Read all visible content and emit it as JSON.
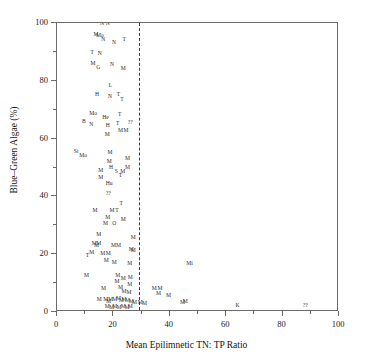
{
  "chart_data": {
    "type": "scatter",
    "title": "",
    "xlabel": "Mean Epilimnetic TN: TP Ratio",
    "ylabel": "Blue–Green Algae (%)",
    "xlim": [
      0,
      100
    ],
    "ylim": [
      0,
      100
    ],
    "grid": false,
    "legend": "none",
    "marker_style": "text-labels",
    "xticks_major": [
      0,
      20,
      40,
      60,
      80,
      100
    ],
    "xticks_minor": [
      10,
      30,
      50,
      70,
      90
    ],
    "yticks_major": [
      0,
      20,
      40,
      60,
      80,
      100
    ],
    "yticks_minor": [
      10,
      30,
      50,
      70,
      90
    ],
    "xtick_labels": [
      "0",
      "20",
      "40",
      "60",
      "80",
      "100"
    ],
    "ytick_labels": [
      "0",
      "20",
      "40",
      "60",
      "80",
      "100"
    ],
    "annotations": [
      {
        "type": "vline",
        "name": "threshold-line",
        "x": 29,
        "style": "dashed"
      }
    ],
    "points": [
      {
        "label": "N",
        "x": 16.0,
        "y": 99.5
      },
      {
        "label": "N",
        "x": 18.0,
        "y": 99.5
      },
      {
        "label": "M",
        "x": 13.8,
        "y": 95.8
      },
      {
        "label": "Mo",
        "x": 15.2,
        "y": 95.5
      },
      {
        "label": "N",
        "x": 16.4,
        "y": 94.0
      },
      {
        "label": "N",
        "x": 20.2,
        "y": 93.0
      },
      {
        "label": "T",
        "x": 23.8,
        "y": 94.0
      },
      {
        "label": "T",
        "x": 12.5,
        "y": 89.5
      },
      {
        "label": "N",
        "x": 15.2,
        "y": 89.3
      },
      {
        "label": "M",
        "x": 12.8,
        "y": 85.8
      },
      {
        "label": "G",
        "x": 14.6,
        "y": 84.3
      },
      {
        "label": "N",
        "x": 19.5,
        "y": 85.5
      },
      {
        "label": "M",
        "x": 23.5,
        "y": 84.0
      },
      {
        "label": "L",
        "x": 19.0,
        "y": 78.3
      },
      {
        "label": "H",
        "x": 14.2,
        "y": 75.0
      },
      {
        "label": "N",
        "x": 18.8,
        "y": 74.5
      },
      {
        "label": "T",
        "x": 21.8,
        "y": 75.0
      },
      {
        "label": "T",
        "x": 23.0,
        "y": 73.5
      },
      {
        "label": "Mo",
        "x": 12.8,
        "y": 68.5
      },
      {
        "label": "B",
        "x": 9.5,
        "y": 65.8
      },
      {
        "label": "N",
        "x": 12.2,
        "y": 64.8
      },
      {
        "label": "He",
        "x": 17.2,
        "y": 67.0
      },
      {
        "label": "T",
        "x": 22.2,
        "y": 68.0
      },
      {
        "label": "T",
        "x": 21.5,
        "y": 65.0
      },
      {
        "label": "??",
        "x": 26.0,
        "y": 65.5
      },
      {
        "label": "H",
        "x": 18.0,
        "y": 64.3
      },
      {
        "label": "M",
        "x": 22.5,
        "y": 62.5
      },
      {
        "label": "M",
        "x": 24.5,
        "y": 62.5
      },
      {
        "label": "M",
        "x": 17.8,
        "y": 61.3
      },
      {
        "label": "St",
        "x": 6.8,
        "y": 55.5
      },
      {
        "label": "Mo",
        "x": 9.3,
        "y": 54.0
      },
      {
        "label": "M",
        "x": 18.8,
        "y": 55.0
      },
      {
        "label": "M",
        "x": 18.5,
        "y": 52.0
      },
      {
        "label": "M",
        "x": 25.0,
        "y": 53.0
      },
      {
        "label": "H",
        "x": 19.2,
        "y": 50.0
      },
      {
        "label": "M",
        "x": 25.0,
        "y": 50.0
      },
      {
        "label": "M",
        "x": 15.5,
        "y": 48.8
      },
      {
        "label": "S",
        "x": 21.0,
        "y": 48.5
      },
      {
        "label": "M",
        "x": 23.3,
        "y": 48.5
      },
      {
        "label": "M",
        "x": 15.5,
        "y": 46.5
      },
      {
        "label": "T",
        "x": 22.5,
        "y": 47.0
      },
      {
        "label": "Hu",
        "x": 18.5,
        "y": 44.3
      },
      {
        "label": "??",
        "x": 18.2,
        "y": 40.8
      },
      {
        "label": "T",
        "x": 22.8,
        "y": 37.3
      },
      {
        "label": "M",
        "x": 13.5,
        "y": 35.0
      },
      {
        "label": "M",
        "x": 19.5,
        "y": 35.0
      },
      {
        "label": "T",
        "x": 21.3,
        "y": 34.8
      },
      {
        "label": "M",
        "x": 18.0,
        "y": 32.5
      },
      {
        "label": "M",
        "x": 23.5,
        "y": 31.8
      },
      {
        "label": "M",
        "x": 17.2,
        "y": 30.3
      },
      {
        "label": "O",
        "x": 20.3,
        "y": 30.3
      },
      {
        "label": "M",
        "x": 14.8,
        "y": 26.5
      },
      {
        "label": "M",
        "x": 27.0,
        "y": 25.5
      },
      {
        "label": "M",
        "x": 13.2,
        "y": 23.5
      },
      {
        "label": "M",
        "x": 14.8,
        "y": 23.5
      },
      {
        "label": "M",
        "x": 14.0,
        "y": 23.0
      },
      {
        "label": "M",
        "x": 20.0,
        "y": 23.0
      },
      {
        "label": "M",
        "x": 21.8,
        "y": 23.0
      },
      {
        "label": "M",
        "x": 26.3,
        "y": 21.5
      },
      {
        "label": "M",
        "x": 27.0,
        "y": 21.0
      },
      {
        "label": "T",
        "x": 10.8,
        "y": 19.5
      },
      {
        "label": "M",
        "x": 12.3,
        "y": 20.3
      },
      {
        "label": "M",
        "x": 16.2,
        "y": 20.0
      },
      {
        "label": "M",
        "x": 18.2,
        "y": 20.0
      },
      {
        "label": "M",
        "x": 17.5,
        "y": 17.5
      },
      {
        "label": "M",
        "x": 20.3,
        "y": 17.0
      },
      {
        "label": "M",
        "x": 25.8,
        "y": 16.5
      },
      {
        "label": "Mi",
        "x": 47.0,
        "y": 16.5
      },
      {
        "label": "M",
        "x": 10.5,
        "y": 12.3
      },
      {
        "label": "M",
        "x": 21.5,
        "y": 12.5
      },
      {
        "label": "M",
        "x": 23.5,
        "y": 11.3
      },
      {
        "label": "M",
        "x": 21.3,
        "y": 10.5
      },
      {
        "label": "M",
        "x": 26.0,
        "y": 11.8
      },
      {
        "label": "M",
        "x": 25.8,
        "y": 9.5
      },
      {
        "label": "M",
        "x": 16.5,
        "y": 7.8
      },
      {
        "label": "M",
        "x": 22.5,
        "y": 8.3
      },
      {
        "label": "M",
        "x": 23.8,
        "y": 7.0
      },
      {
        "label": "M",
        "x": 25.5,
        "y": 6.5
      },
      {
        "label": "M",
        "x": 34.5,
        "y": 7.8
      },
      {
        "label": "M",
        "x": 36.5,
        "y": 7.8
      },
      {
        "label": "M",
        "x": 36.0,
        "y": 6.3
      },
      {
        "label": "M",
        "x": 39.5,
        "y": 5.5
      },
      {
        "label": "M",
        "x": 15.0,
        "y": 4.3
      },
      {
        "label": "M",
        "x": 17.3,
        "y": 4.0
      },
      {
        "label": "M",
        "x": 18.3,
        "y": 3.5
      },
      {
        "label": "M",
        "x": 19.0,
        "y": 4.3
      },
      {
        "label": "M",
        "x": 20.5,
        "y": 4.0
      },
      {
        "label": "M",
        "x": 21.8,
        "y": 4.5
      },
      {
        "label": "M",
        "x": 22.8,
        "y": 3.8
      },
      {
        "label": "M",
        "x": 23.8,
        "y": 4.2
      },
      {
        "label": "M",
        "x": 25.0,
        "y": 3.8
      },
      {
        "label": "M",
        "x": 26.3,
        "y": 3.3
      },
      {
        "label": "M",
        "x": 27.5,
        "y": 3.0
      },
      {
        "label": "M",
        "x": 29.5,
        "y": 3.0
      },
      {
        "label": "M",
        "x": 31.0,
        "y": 2.8
      },
      {
        "label": "M",
        "x": 44.5,
        "y": 3.2
      },
      {
        "label": "M",
        "x": 45.5,
        "y": 3.5
      },
      {
        "label": "M",
        "x": 17.8,
        "y": 1.8
      },
      {
        "label": "M",
        "x": 19.3,
        "y": 1.5
      },
      {
        "label": "M",
        "x": 20.5,
        "y": 1.8
      },
      {
        "label": "M",
        "x": 22.0,
        "y": 1.5
      },
      {
        "label": "M",
        "x": 23.5,
        "y": 1.8
      },
      {
        "label": "M",
        "x": 24.8,
        "y": 1.5
      },
      {
        "label": "M",
        "x": 26.0,
        "y": 1.8
      },
      {
        "label": "K",
        "x": 64.0,
        "y": 2.0
      },
      {
        "label": "??",
        "x": 88.0,
        "y": 2.0
      }
    ]
  }
}
